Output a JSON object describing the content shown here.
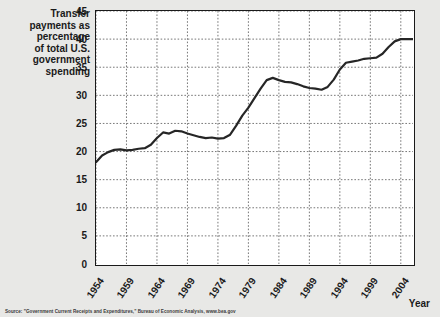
{
  "chart_data": {
    "type": "line",
    "title": "",
    "ylabel": "Transfer payments as percentage of total U.S. government spending",
    "xlabel": "Year",
    "ylim": [
      0,
      45
    ],
    "xlim": [
      1954,
      2006
    ],
    "grid": true,
    "legend": "none",
    "y_ticks": [
      "45",
      "40",
      "35",
      "30",
      "25",
      "20",
      "15",
      "10",
      "5",
      "0"
    ],
    "y_tick_values": [
      45,
      40,
      35,
      30,
      25,
      20,
      15,
      10,
      5,
      0
    ],
    "x_ticks": [
      "1954",
      "1959",
      "1964",
      "1969",
      "1974",
      "1979",
      "1984",
      "1989",
      "1994",
      "1999",
      "2004"
    ],
    "x_tick_values": [
      1954,
      1959,
      1964,
      1969,
      1974,
      1979,
      1984,
      1989,
      1994,
      1999,
      2004
    ],
    "series": [
      {
        "name": "Transfer payments as percentage of total U.S. government spending",
        "color": "#262626",
        "x": [
          1954,
          1955,
          1956,
          1957,
          1958,
          1959,
          1960,
          1961,
          1962,
          1963,
          1964,
          1965,
          1966,
          1967,
          1968,
          1969,
          1970,
          1971,
          1972,
          1973,
          1974,
          1975,
          1976,
          1977,
          1978,
          1979,
          1980,
          1981,
          1982,
          1983,
          1984,
          1985,
          1986,
          1987,
          1988,
          1989,
          1990,
          1991,
          1992,
          1993,
          1994,
          1995,
          1996,
          1997,
          1998,
          1999,
          2000,
          2001,
          2002,
          2003,
          2004,
          2005,
          2006
        ],
        "values": [
          18.1,
          19.3,
          19.9,
          20.3,
          20.4,
          20.2,
          20.3,
          20.5,
          20.6,
          21.2,
          22.4,
          23.4,
          23.2,
          23.7,
          23.6,
          23.2,
          22.9,
          22.6,
          22.4,
          22.5,
          22.3,
          22.4,
          23.0,
          24.6,
          26.4,
          27.8,
          29.5,
          31.2,
          32.7,
          33.1,
          32.7,
          32.4,
          32.3,
          32.0,
          31.6,
          31.3,
          31.2,
          31.0,
          31.5,
          32.8,
          34.6,
          35.8,
          36.0,
          36.2,
          36.5,
          36.6,
          36.7,
          37.4,
          38.6,
          39.6,
          40.0,
          40.0,
          40.0
        ]
      }
    ],
    "source": "Source: \"Government Current Receipts and Expenditures,\" Bureau of Economic Analysis, www.bea.gov"
  },
  "axis": {
    "y_title": "Transfer\npayments as\npercentage\nof total U.S.\ngovernment\nspending",
    "x_title": "Year"
  }
}
